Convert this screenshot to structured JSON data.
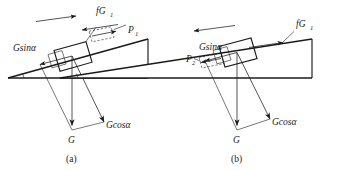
{
  "figure": {
    "stroke_color": "#1b1b1b",
    "background_color": "#ffffff"
  },
  "panels": [
    {
      "id": "a",
      "caption": "(a)",
      "motion_direction": "up-the-incline",
      "labels": {
        "friction": "fG",
        "friction_sub": "1",
        "applied": "P",
        "applied_sub": "1",
        "gravity_parallel": "Gsinα",
        "gravity_perpendicular": "Gcosα",
        "weight": "G"
      }
    },
    {
      "id": "b",
      "caption": "(b)",
      "motion_direction": "down-the-incline",
      "labels": {
        "friction": "fG",
        "friction_sub": "1",
        "applied": "P",
        "applied_sub": "2",
        "gravity_parallel": "Gsinα",
        "gravity_perpendicular": "Gcosα",
        "weight": "G"
      }
    }
  ]
}
